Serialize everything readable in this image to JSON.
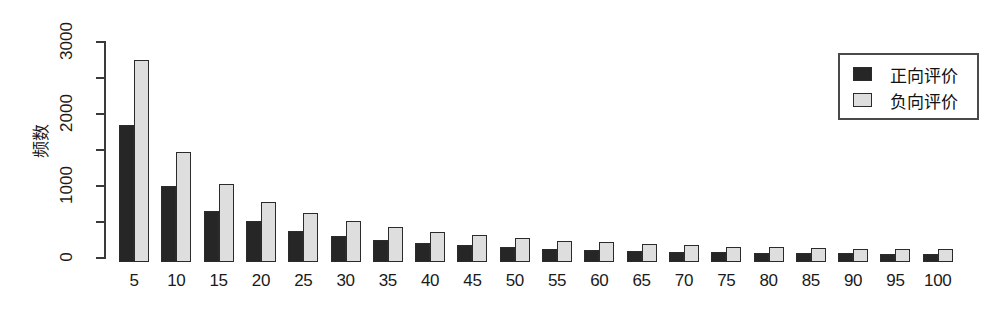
{
  "chart_data": {
    "type": "bar",
    "title": "",
    "xlabel": "",
    "ylabel": "频数",
    "ylim": [
      0,
      3000
    ],
    "grid": false,
    "legend_position": "top-right",
    "categories": [
      "5",
      "10",
      "15",
      "20",
      "25",
      "30",
      "35",
      "40",
      "45",
      "50",
      "55",
      "60",
      "65",
      "70",
      "75",
      "80",
      "85",
      "90",
      "95",
      "100"
    ],
    "series": [
      {
        "name": "正向评价",
        "color": "#262626",
        "values": [
          1900,
          1050,
          710,
          570,
          430,
          360,
          300,
          265,
          230,
          205,
          185,
          170,
          155,
          145,
          135,
          130,
          125,
          120,
          115,
          110
        ]
      },
      {
        "name": "负向评价",
        "color": "#dedede",
        "values": [
          2800,
          1530,
          1090,
          830,
          680,
          570,
          490,
          420,
          370,
          330,
          295,
          275,
          250,
          235,
          215,
          205,
          195,
          185,
          180,
          175
        ]
      }
    ],
    "y_ticks": [
      {
        "value": 0,
        "label": "0"
      },
      {
        "value": 500,
        "label": ""
      },
      {
        "value": 1000,
        "label": "1000"
      },
      {
        "value": 1500,
        "label": ""
      },
      {
        "value": 2000,
        "label": "2000"
      },
      {
        "value": 2500,
        "label": ""
      },
      {
        "value": 3000,
        "label": "3000"
      }
    ]
  },
  "legend": {
    "items": [
      {
        "label": "正向评价",
        "swatch": "positive"
      },
      {
        "label": "负向评价",
        "swatch": "negative"
      }
    ]
  },
  "axis": {
    "y_title": "频数"
  }
}
